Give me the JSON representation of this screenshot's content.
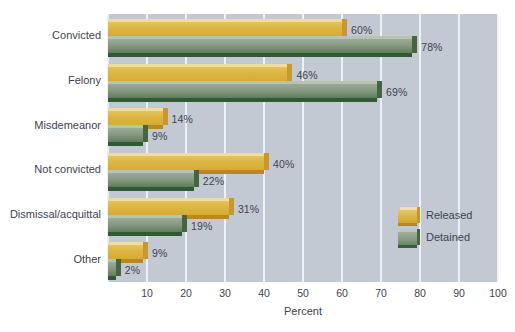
{
  "chart_data": {
    "type": "bar",
    "orientation": "horizontal",
    "title": "",
    "xlabel": "Percent",
    "ylabel": "",
    "xlim": [
      0,
      100
    ],
    "xticks": [
      0,
      10,
      20,
      30,
      40,
      50,
      60,
      70,
      80,
      90,
      100
    ],
    "xtick_labels": [
      "",
      "10",
      "20",
      "30",
      "40",
      "50",
      "60",
      "70",
      "80",
      "90",
      "100"
    ],
    "grid": true,
    "legend_position": "right-inside",
    "categories": [
      "Convicted",
      "Felony",
      "Misdemeanor",
      "Not convicted",
      "Dismissal/acquittal",
      "Other"
    ],
    "series": [
      {
        "name": "Released",
        "color": "#d9b243",
        "values": [
          60,
          46,
          14,
          40,
          31,
          9
        ],
        "data_labels": [
          "60%",
          "46%",
          "14%",
          "40%",
          "31%",
          "9%"
        ]
      },
      {
        "name": "Detained",
        "color": "#6a8563",
        "values": [
          78,
          69,
          9,
          22,
          19,
          2
        ],
        "data_labels": [
          "78%",
          "69%",
          "9%",
          "22%",
          "19%",
          "2%"
        ]
      }
    ],
    "plot_background": "#c3c9d2",
    "gridline_color": "#f2f4f7",
    "text_color": "#3d4450"
  },
  "legend": {
    "items": [
      {
        "label": "Released",
        "key": "released"
      },
      {
        "label": "Detained",
        "key": "detained"
      }
    ]
  }
}
